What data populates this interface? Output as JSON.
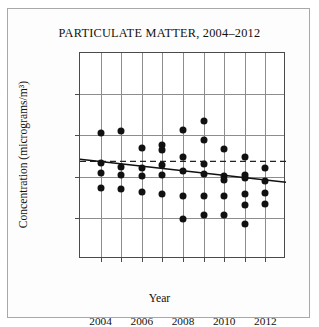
{
  "figure": {
    "title": "PARTICULATE MATTER, 2004–2012",
    "xlabel": "Year",
    "ylabel": "Concentration (micrograms/m³)",
    "border_color": "#a8a8a8",
    "background": "#fdfdfd"
  },
  "chart_data": {
    "type": "scatter",
    "title": "PARTICULATE MATTER, 2004–2012",
    "xlabel": "Year",
    "ylabel": "Concentration (micrograms/m³)",
    "xlim": [
      2003.0,
      2013.0
    ],
    "ylim": [
      0,
      25
    ],
    "yticks": [
      0,
      5,
      10,
      15,
      20,
      25
    ],
    "ytick_labels": [
      "0",
      "5",
      "10",
      "15",
      "20",
      "25"
    ],
    "xticks": [
      2004,
      2005,
      2006,
      2007,
      2008,
      2009,
      2010,
      2011,
      2012
    ],
    "xtick_labels": [
      "2004",
      "",
      "2006",
      "",
      "2008",
      "",
      "2010",
      "",
      "2012"
    ],
    "xtick_labels_shown": [
      "2004",
      "2006",
      "2008",
      "2010",
      "2012"
    ],
    "grid": true,
    "grid_color": "#8d8d8d",
    "legend": "none",
    "marker_color": "#111111",
    "marker_shape": "circle",
    "points": [
      {
        "x": 2004,
        "y": 15.3
      },
      {
        "x": 2004,
        "y": 11.7
      },
      {
        "x": 2004,
        "y": 10.4
      },
      {
        "x": 2004,
        "y": 8.6
      },
      {
        "x": 2005,
        "y": 15.5
      },
      {
        "x": 2005,
        "y": 11.2
      },
      {
        "x": 2005,
        "y": 10.2
      },
      {
        "x": 2005,
        "y": 8.5
      },
      {
        "x": 2006,
        "y": 13.5
      },
      {
        "x": 2006,
        "y": 11.0
      },
      {
        "x": 2006,
        "y": 10.1
      },
      {
        "x": 2006,
        "y": 8.1
      },
      {
        "x": 2007,
        "y": 13.8
      },
      {
        "x": 2007,
        "y": 13.2
      },
      {
        "x": 2007,
        "y": 11.4
      },
      {
        "x": 2007,
        "y": 10.2
      },
      {
        "x": 2007,
        "y": 7.9
      },
      {
        "x": 2008,
        "y": 15.6
      },
      {
        "x": 2008,
        "y": 12.4
      },
      {
        "x": 2008,
        "y": 10.7
      },
      {
        "x": 2008,
        "y": 7.6
      },
      {
        "x": 2008,
        "y": 4.9
      },
      {
        "x": 2009,
        "y": 16.7
      },
      {
        "x": 2009,
        "y": 14.4
      },
      {
        "x": 2009,
        "y": 11.5
      },
      {
        "x": 2009,
        "y": 10.3
      },
      {
        "x": 2009,
        "y": 7.7
      },
      {
        "x": 2009,
        "y": 5.3
      },
      {
        "x": 2010,
        "y": 13.4
      },
      {
        "x": 2010,
        "y": 10.1
      },
      {
        "x": 2010,
        "y": 9.6
      },
      {
        "x": 2010,
        "y": 7.6
      },
      {
        "x": 2010,
        "y": 5.3
      },
      {
        "x": 2011,
        "y": 12.4
      },
      {
        "x": 2011,
        "y": 10.2
      },
      {
        "x": 2011,
        "y": 9.8
      },
      {
        "x": 2011,
        "y": 7.9
      },
      {
        "x": 2011,
        "y": 6.6
      },
      {
        "x": 2011,
        "y": 4.3
      },
      {
        "x": 2012,
        "y": 11.0
      },
      {
        "x": 2012,
        "y": 9.5
      },
      {
        "x": 2012,
        "y": 8.0
      },
      {
        "x": 2012,
        "y": 6.7
      }
    ],
    "trend_line": {
      "name": "regression line",
      "style": "solid",
      "color": "#111111",
      "x_start": 2003.0,
      "y_start": 12.1,
      "x_end": 2013.0,
      "y_end": 9.3
    },
    "reference_line": {
      "name": "mean reference",
      "style": "dashed",
      "color": "#222222",
      "y": 11.85,
      "orientation": "horizontal"
    }
  }
}
